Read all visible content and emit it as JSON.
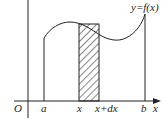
{
  "diagram": {
    "curve_label": "y=f(x)",
    "origin_label": "O",
    "x_axis_label": "x",
    "lower_bound_label": "a",
    "upper_bound_label": "b",
    "strip_left_label": "x",
    "strip_right_label": "x+dx",
    "colors": {
      "line": "#222222",
      "background": "#ffffff"
    }
  }
}
